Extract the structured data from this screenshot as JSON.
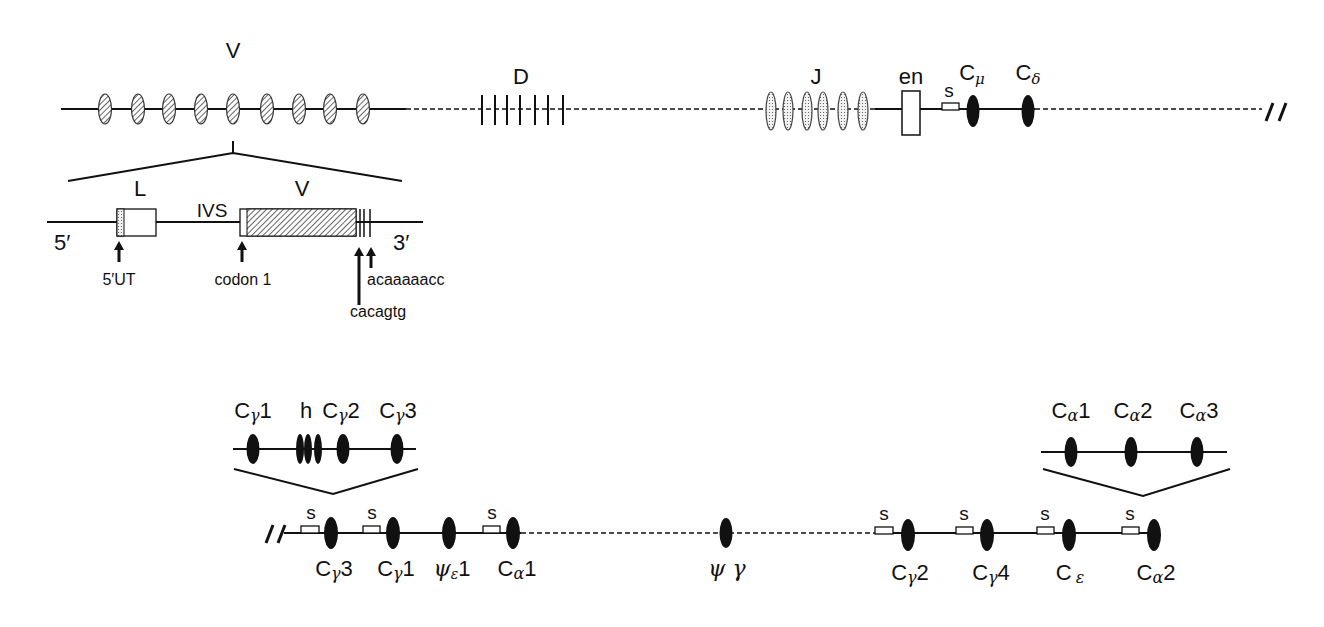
{
  "colors": {
    "line": "#111111",
    "background": "#ffffff",
    "v_fill": "hatched",
    "j_fill": "stippled",
    "c_fill": "#111111"
  },
  "top_locus": {
    "segments": [
      {
        "label": "V",
        "count": 9,
        "style": "hatched-oval"
      },
      {
        "label": "D",
        "count": 7,
        "style": "vertical-tick"
      },
      {
        "label": "J",
        "count": 6,
        "style": "stippled-oval"
      },
      {
        "label": "en",
        "style": "open-box"
      },
      {
        "label": "s",
        "style": "switch-box"
      },
      {
        "label": "Cμ",
        "base": "C",
        "sub": "μ",
        "style": "filled-oval"
      },
      {
        "label": "Cδ",
        "base": "C",
        "sub": "δ",
        "style": "filled-oval"
      }
    ],
    "break_symbol": "//"
  },
  "v_gene_detail": {
    "end5": "5′",
    "end3": "3′",
    "exon_L": "L",
    "intron": "IVS",
    "exon_V": "V",
    "annotations": [
      "5′UT",
      "codon 1",
      "acaaaaacc",
      "cacagtg"
    ]
  },
  "bottom_locus": {
    "break_symbol": "//",
    "switch_label": "s",
    "genes": [
      {
        "base": "C",
        "sub": "γ",
        "num": "3"
      },
      {
        "base": "C",
        "sub": "γ",
        "num": "1"
      },
      {
        "base": "ψ",
        "sub": "ε",
        "num": "1"
      },
      {
        "base": "C",
        "sub": "α",
        "num": "1"
      },
      {
        "base": "ψ",
        "sub": "",
        "num": " γ"
      },
      {
        "base": "C",
        "sub": "γ",
        "num": "2"
      },
      {
        "base": "C",
        "sub": "γ",
        "num": "4"
      },
      {
        "base": "C",
        "sub": "ε",
        "num": ""
      },
      {
        "base": "C",
        "sub": "α",
        "num": "2"
      }
    ]
  },
  "gamma_detail": {
    "labels": [
      {
        "base": "C",
        "sub": "γ",
        "num": "1"
      },
      {
        "base": "h",
        "sub": "",
        "num": ""
      },
      {
        "base": "C",
        "sub": "γ",
        "num": "2"
      },
      {
        "base": "C",
        "sub": "γ",
        "num": "3"
      }
    ]
  },
  "alpha_detail": {
    "labels": [
      {
        "base": "C",
        "sub": "α",
        "num": "1"
      },
      {
        "base": "C",
        "sub": "α",
        "num": "2"
      },
      {
        "base": "C",
        "sub": "α",
        "num": "3"
      }
    ]
  }
}
